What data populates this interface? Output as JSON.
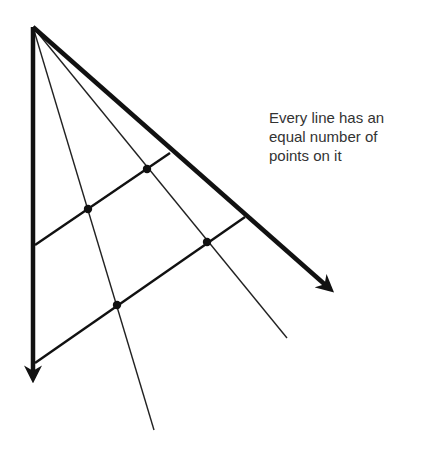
{
  "caption": {
    "lines": [
      "Every line has an",
      "equal number of",
      "points on it"
    ]
  },
  "colors": {
    "stroke": "#111111",
    "text": "#333333",
    "background": "#ffffff"
  },
  "geometry": {
    "apex": [
      33,
      27
    ],
    "axis_left_end": [
      33,
      381
    ],
    "axis_right_end": [
      333,
      292
    ],
    "rays": [
      {
        "name": "ray-steep",
        "end": [
          154,
          430
        ],
        "points": [
          [
            88,
            209
          ],
          [
            117,
            305
          ]
        ]
      },
      {
        "name": "ray-shallow",
        "end": [
          287,
          338
        ],
        "points": [
          [
            147,
            169
          ],
          [
            207,
            242
          ]
        ]
      }
    ],
    "crossbars": [
      {
        "name": "crossbar-upper",
        "from": [
          35,
          245
        ],
        "to": [
          170,
          153
        ]
      },
      {
        "name": "crossbar-lower",
        "from": [
          35,
          363
        ],
        "to": [
          245,
          217
        ]
      }
    ],
    "dots": [
      [
        147,
        169
      ],
      [
        88,
        209
      ],
      [
        207,
        242
      ],
      [
        117,
        305
      ]
    ]
  }
}
